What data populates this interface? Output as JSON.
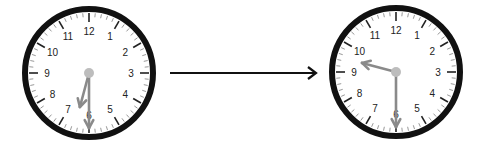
{
  "diagram": {
    "clocks": [
      {
        "id": "start",
        "time": "6:30",
        "hour": 6,
        "minute": 30,
        "cx": 89,
        "cy": 73,
        "r": 64
      },
      {
        "id": "end",
        "time": "9:30",
        "hour": 9,
        "minute": 30,
        "cx": 396,
        "cy": 72,
        "r": 64
      }
    ],
    "numerals": [
      "12",
      "1",
      "2",
      "3",
      "4",
      "5",
      "6",
      "7",
      "8",
      "9",
      "10",
      "11"
    ],
    "arrow": {
      "x1": 170,
      "x2": 316,
      "y": 73
    },
    "colors": {
      "rim": "#111111",
      "face": "#ffffff",
      "hand": "#8a8a8a",
      "tick": "#999999",
      "numeral": "#222222",
      "arrow": "#111111"
    }
  }
}
